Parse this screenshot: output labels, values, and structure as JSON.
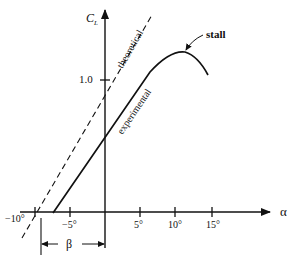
{
  "diagram": {
    "type": "lift-curve",
    "axes": {
      "y_label": "C",
      "y_label_sub": "L",
      "x_label": "α",
      "y_tick_labels": [
        "1.0"
      ],
      "x_tick_labels": [
        "−10°",
        "−5°",
        "5°",
        "10°",
        "15°"
      ]
    },
    "curves": [
      {
        "name": "theoretical",
        "style": "dashed",
        "label": "theoretical"
      },
      {
        "name": "experimental",
        "style": "solid",
        "label": "experimental"
      }
    ],
    "annotations": {
      "stall": "stall",
      "beta": "β"
    }
  }
}
